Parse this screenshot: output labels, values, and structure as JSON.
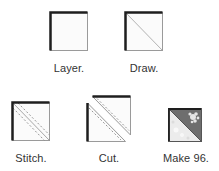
{
  "diagram": {
    "steps": [
      {
        "label": "Layer.",
        "icon": "layered-square-icon"
      },
      {
        "label": "Draw.",
        "icon": "square-diagonal-line-icon"
      },
      {
        "label": "Stitch.",
        "icon": "square-stitch-lines-icon"
      },
      {
        "label": "Cut.",
        "icon": "cut-triangles-icon"
      },
      {
        "label": "Make 96.",
        "icon": "half-square-triangle-icon"
      }
    ],
    "colors": {
      "outline": "#1e1e1e",
      "line": "#8a8a8a",
      "fabric_dark": "#6e6e6e",
      "fabric_light": "#efefef"
    }
  }
}
